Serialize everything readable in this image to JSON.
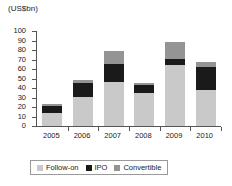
{
  "chart_data": {
    "type": "bar",
    "subtype": "stacked-vertical",
    "title": "",
    "xlabel": "",
    "ylabel": "(US$bn)",
    "ylim": [
      0,
      100
    ],
    "ytick_step": 10,
    "yticks": [
      100,
      90,
      80,
      70,
      60,
      50,
      40,
      30,
      20,
      10,
      0
    ],
    "grid": false,
    "legend_position": "bottom",
    "categories": [
      "2005",
      "2006",
      "2007",
      "2008",
      "2009",
      "2010"
    ],
    "series": [
      {
        "name": "Follow-on",
        "color": "#c9c9c9",
        "values": [
          14,
          31,
          46,
          35,
          64,
          38
        ]
      },
      {
        "name": "IPO",
        "color": "#1a1a1a",
        "values": [
          7,
          14,
          19,
          8,
          7,
          24
        ]
      },
      {
        "name": "Convertible",
        "color": "#949494",
        "values": [
          2,
          3,
          14,
          2,
          17,
          5
        ]
      }
    ],
    "totals": [
      23,
      48,
      79,
      45,
      88,
      67
    ]
  },
  "legend": {
    "items": [
      {
        "label": "Follow-on",
        "swatch_name": "legend-swatch-follow-on"
      },
      {
        "label": "IPO",
        "swatch_name": "legend-swatch-ipo"
      },
      {
        "label": "Convertible",
        "swatch_name": "legend-swatch-convertible"
      }
    ]
  }
}
